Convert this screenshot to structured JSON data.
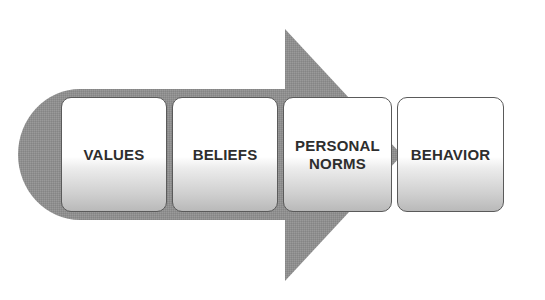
{
  "diagram": {
    "type": "process-flow-arrow",
    "direction": "left-to-right",
    "colors": {
      "arrow_fill": "#8f8f8f",
      "box_border": "#5a5a5a",
      "box_top": "#ffffff",
      "box_bottom": "#b9b9b9",
      "text": "#2e2e2e"
    },
    "steps": [
      {
        "label": "VALUES"
      },
      {
        "label": "BELIEFS"
      },
      {
        "label": "PERSONAL\nNORMS"
      },
      {
        "label": "BEHAVIOR"
      }
    ]
  }
}
